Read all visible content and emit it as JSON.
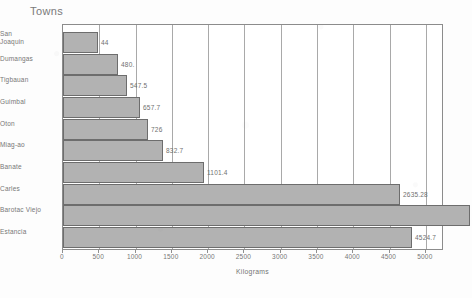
{
  "chart_data": {
    "type": "bar",
    "orientation": "horizontal",
    "title": "Towns",
    "xlabel": "Kilograms",
    "ylabel": "",
    "xlim": [
      0,
      5250
    ],
    "ylim": null,
    "grid": "vertical-only",
    "legend": "none",
    "categories": [
      "San Joaquin",
      "Dumangas",
      "Tigbauan",
      "Guimbal",
      "Oton",
      "Miag-ao",
      "Banate",
      "Carles",
      "Barotac Viejo",
      "Estancia"
    ],
    "values": [
      44,
      480,
      547.5,
      657.7,
      726,
      832.7,
      1101.4,
      2635.28,
      3185.9,
      4524.7
    ],
    "value_labels": [
      "44",
      "480.",
      "547.5",
      "657.7",
      "726",
      "832.7",
      "1101.4",
      "2635.28",
      "3185.9",
      "4524.7"
    ],
    "xticks": [
      0,
      500,
      1000,
      1500,
      2000,
      2500,
      3000,
      3500,
      4000,
      4500,
      5000
    ],
    "xtick_labels": [
      "0",
      "500",
      "1000",
      "1500",
      "2000",
      "2500",
      "3000",
      "3500",
      "4000",
      "4500",
      "5000"
    ],
    "bar_color": "#b2b2b2",
    "bar_edge_color": "#6d6d6d",
    "axis_color": "#8c8c8c",
    "text_color": "#777777",
    "rendered_bar_widths_px": [
      35,
      55,
      64,
      77,
      85,
      100,
      141,
      337,
      407,
      349
    ],
    "rendered_row_tops_px": [
      7,
      29,
      50,
      72,
      94,
      115,
      137,
      159,
      180,
      202
    ],
    "rendered_label_tops_px": [
      6,
      31,
      52,
      74,
      96,
      117,
      139,
      161,
      182,
      204
    ],
    "rendered_label_line2": [
      "Joaquin",
      "",
      "",
      "",
      "",
      "",
      "",
      "",
      "",
      ""
    ],
    "rendered_label_line1": [
      "San",
      "Dumangas",
      "Tigbauan",
      "Guimbal",
      "Oton",
      "Miag-ao",
      "Banate",
      "Carles",
      "Barotac Viejo",
      "Estancia"
    ]
  }
}
